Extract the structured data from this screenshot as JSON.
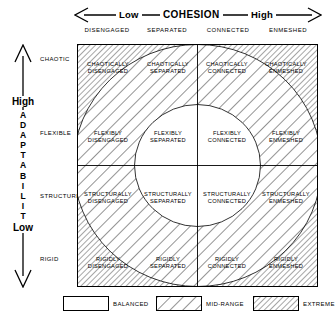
{
  "axes": {
    "cohesion": {
      "title": "COHESION",
      "low": "Low",
      "high": "High",
      "columns": [
        "DISENGAGED",
        "SEPARATED",
        "CONNECTED",
        "ENMESHED"
      ]
    },
    "adaptability": {
      "title": "ADAPTABILITY",
      "letters": [
        "A",
        "D",
        "A",
        "P",
        "T",
        "A",
        "B",
        "I",
        "L",
        "I",
        "T",
        "Y"
      ],
      "high": "High",
      "low": "Low",
      "rows": [
        "CHAOTIC",
        "FLEXIBLE",
        "STRUCTURED",
        "RIGID"
      ]
    }
  },
  "cells": [
    [
      {
        "line1": "CHAOTICALLY",
        "line2": "DISENGAGED",
        "zone": "EXTREME"
      },
      {
        "line1": "CHAOTICALLY",
        "line2": "SEPARATED",
        "zone": "MID-RANGE"
      },
      {
        "line1": "CHAOTICALLY",
        "line2": "CONNECTED",
        "zone": "MID-RANGE"
      },
      {
        "line1": "CHAOTICALLY",
        "line2": "ENMESHED",
        "zone": "EXTREME"
      }
    ],
    [
      {
        "line1": "FLEXIBLY",
        "line2": "DISENGAGED",
        "zone": "MID-RANGE"
      },
      {
        "line1": "FLEXIBLY",
        "line2": "SEPARATED",
        "zone": "BALANCED"
      },
      {
        "line1": "FLEXIBLY",
        "line2": "CONNECTED",
        "zone": "BALANCED"
      },
      {
        "line1": "FLEXIBLY",
        "line2": "ENMESHED",
        "zone": "MID-RANGE"
      }
    ],
    [
      {
        "line1": "STRUCTURALLY",
        "line2": "DISENGAGED",
        "zone": "MID-RANGE"
      },
      {
        "line1": "STRUCTURALLY",
        "line2": "SEPARATED",
        "zone": "BALANCED"
      },
      {
        "line1": "STRUCTURALLY",
        "line2": "CONNECTED",
        "zone": "BALANCED"
      },
      {
        "line1": "STRUCTURALLY",
        "line2": "ENMESHED",
        "zone": "MID-RANGE"
      }
    ],
    [
      {
        "line1": "RIGIDLY",
        "line2": "DISENGAGED",
        "zone": "EXTREME"
      },
      {
        "line1": "RIGIDLY",
        "line2": "SEPARATED",
        "zone": "MID-RANGE"
      },
      {
        "line1": "RIGIDLY",
        "line2": "CONNECTED",
        "zone": "MID-RANGE"
      },
      {
        "line1": "RIGIDLY",
        "line2": "ENMESHED",
        "zone": "EXTREME"
      }
    ]
  ],
  "legend": [
    {
      "label": "BALANCED",
      "pattern": "none"
    },
    {
      "label": "MID-RANGE",
      "pattern": "wide-hatch"
    },
    {
      "label": "EXTREME",
      "pattern": "dense-hatch"
    }
  ],
  "colors": {
    "line": "#000000",
    "background": "#ffffff",
    "hatch": "#3a3a3a"
  }
}
